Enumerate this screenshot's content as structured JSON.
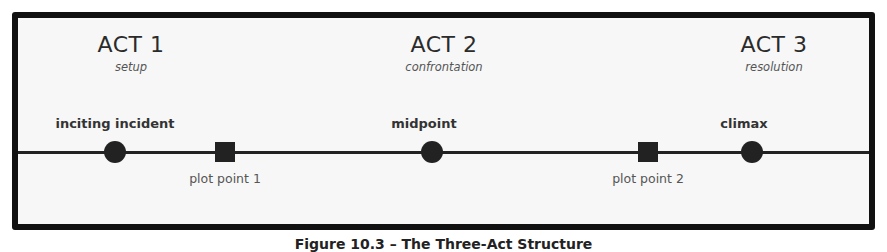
{
  "diagram": {
    "acts": [
      {
        "title": "ACT 1",
        "subtitle": "setup"
      },
      {
        "title": "ACT 2",
        "subtitle": "confrontation"
      },
      {
        "title": "ACT 3",
        "subtitle": "resolution"
      }
    ],
    "events": [
      {
        "label": "inciting incident",
        "shape": "circle",
        "position": "above"
      },
      {
        "label": "plot point 1",
        "shape": "square",
        "position": "below"
      },
      {
        "label": "midpoint",
        "shape": "circle",
        "position": "above"
      },
      {
        "label": "plot point 2",
        "shape": "square",
        "position": "below"
      },
      {
        "label": "climax",
        "shape": "circle",
        "position": "above"
      }
    ]
  },
  "caption": "Figure 10.3 – The Three-Act Structure"
}
